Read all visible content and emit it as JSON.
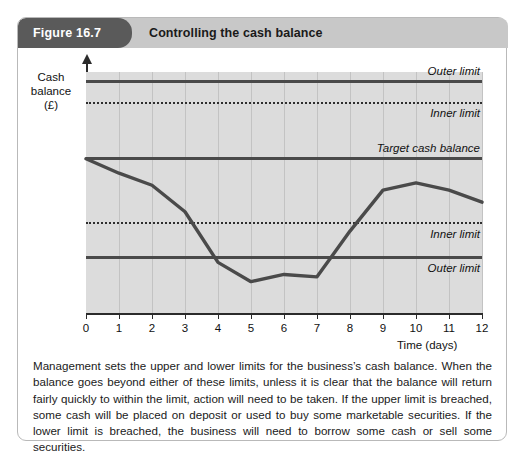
{
  "figure": {
    "badge": "Figure 16.7",
    "title": "Controlling the cash balance",
    "caption": "Management sets the upper and lower limits for the business’s cash balance. When the balance goes beyond either of these limits, unless it is clear that the balance will return fairly quickly to within the limit, action will need to be taken. If the upper limit is breached, some cash will be placed on deposit or used to buy some marketable securities. If the lower limit is breached, the business will need to borrow some cash or sell some securities."
  },
  "colors": {
    "badge_bg": "#5a5a5a",
    "header_bg": "#c8c8c8",
    "plot_bg": "#dcdcdc",
    "line": "#4a4a4a",
    "series": "#4a4a4a",
    "grid": "#c3c3c3",
    "axis": "#2b2b2b"
  },
  "chart_data": {
    "type": "line",
    "title": "Controlling the cash balance",
    "xlabel": "Time (days)",
    "ylabel": "Cash balance (£)",
    "ylabel_lines": [
      "Cash",
      "balance",
      "(£)"
    ],
    "x": [
      0,
      1,
      2,
      3,
      4,
      5,
      6,
      7,
      8,
      9,
      10,
      11,
      12
    ],
    "categories": [
      "0",
      "1",
      "2",
      "3",
      "4",
      "5",
      "6",
      "7",
      "8",
      "9",
      "10",
      "11",
      "12"
    ],
    "xlim": [
      0,
      12
    ],
    "ylim": [
      0,
      100
    ],
    "grid": "vertical",
    "legend": "none",
    "series": [
      {
        "name": "Cash balance",
        "values": [
          64,
          58,
          53,
          42,
          21,
          13,
          16,
          15,
          34,
          51,
          54,
          51,
          46
        ]
      }
    ],
    "reference_lines": [
      {
        "id": "outer-upper",
        "label": "Outer limit",
        "value": 96,
        "style": "solid"
      },
      {
        "id": "inner-upper",
        "label": "Inner limit",
        "value": 87,
        "style": "dotted"
      },
      {
        "id": "target",
        "label": "Target cash balance",
        "value": 64,
        "style": "solid"
      },
      {
        "id": "inner-lower",
        "label": "Inner limit",
        "value": 37,
        "style": "dotted"
      },
      {
        "id": "outer-lower",
        "label": "Outer limit",
        "value": 23,
        "style": "solid"
      }
    ]
  }
}
